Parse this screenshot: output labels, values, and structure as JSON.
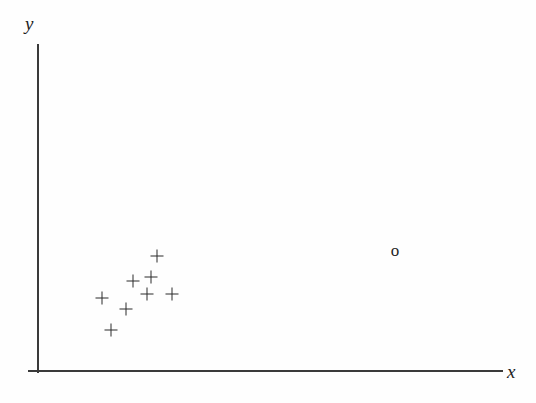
{
  "figure": {
    "background_color": "#fefefe",
    "axis_color": "#3a3a3a",
    "marker_color": "#2b2b2b"
  },
  "axes": {
    "x_label": "x",
    "y_label": "y",
    "show_ticks": false,
    "show_grid": false,
    "show_tick_labels": false,
    "origin_px": [
      38,
      371
    ],
    "y_axis_top_px": 44,
    "x_axis_right_px": 502
  },
  "chart_data": {
    "type": "scatter",
    "title": "",
    "xlabel": "x",
    "ylabel": "y",
    "grid": false,
    "legend": null,
    "axis_ticks": [],
    "series": [
      {
        "name": "cluster",
        "marker": "+",
        "count": 8,
        "points_px": [
          [
            157,
            256
          ],
          [
            151,
            277
          ],
          [
            133,
            281
          ],
          [
            147,
            294
          ],
          [
            172,
            294
          ],
          [
            102,
            298
          ],
          [
            126,
            309
          ],
          [
            111,
            330
          ]
        ]
      },
      {
        "name": "outlier",
        "marker": "o",
        "count": 1,
        "points_px": [
          [
            395,
            250
          ]
        ]
      }
    ]
  },
  "markers": {
    "plus_glyph": "+",
    "circle_glyph": "o"
  }
}
